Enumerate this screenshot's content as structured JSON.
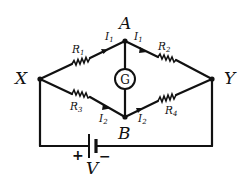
{
  "diagram": {
    "type": "circuit",
    "nodes": {
      "x": "X",
      "y": "Y",
      "a": "A",
      "b": "B"
    },
    "resistors": {
      "r1": "R",
      "r1_sub": "1",
      "r2": "R",
      "r2_sub": "2",
      "r3": "R",
      "r3_sub": "3",
      "r4": "R",
      "r4_sub": "4"
    },
    "currents": {
      "i1_left": "I",
      "i1_left_sub": "1",
      "i1_right": "I",
      "i1_right_sub": "1",
      "i2_left": "I",
      "i2_left_sub": "2",
      "i2_right": "I",
      "i2_right_sub": "2"
    },
    "galvanometer": "G",
    "battery": {
      "label": "V",
      "plus": "+",
      "minus": "−"
    },
    "colors": {
      "ink": "#111111",
      "background": "#ffffff"
    }
  }
}
